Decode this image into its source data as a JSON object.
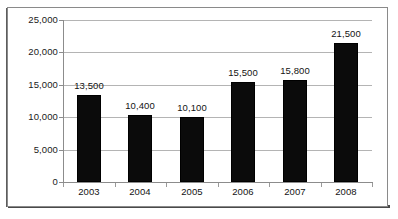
{
  "chart_data": {
    "type": "bar",
    "title": "",
    "subtitle": "",
    "xlabel": "",
    "ylabel": "",
    "categories": [
      "2003",
      "2004",
      "2005",
      "2006",
      "2007",
      "2008"
    ],
    "values": [
      13500,
      10400,
      10100,
      15500,
      15800,
      21500
    ],
    "data_labels": [
      "13,500",
      "10,400",
      "10,100",
      "15,500",
      "15,800",
      "21,500"
    ],
    "ylim": [
      0,
      25000
    ],
    "y_ticks": [
      0,
      5000,
      10000,
      15000,
      20000,
      25000
    ],
    "y_tick_labels": [
      "0",
      "5,000",
      "10,000",
      "15,000",
      "20,000",
      "25,000"
    ],
    "grid": true,
    "legend": false,
    "legend_position": "none",
    "series": [
      {
        "name": "",
        "values": [
          13500,
          10400,
          10100,
          15500,
          15800,
          21500
        ]
      }
    ],
    "colors": {
      "bar_fill": "#0b0b0b",
      "gridline": "#b4b4b4",
      "axis": "#8c8c8c",
      "text": "#131313",
      "background": "#ffffff",
      "frame": "#8a8a8a"
    }
  }
}
